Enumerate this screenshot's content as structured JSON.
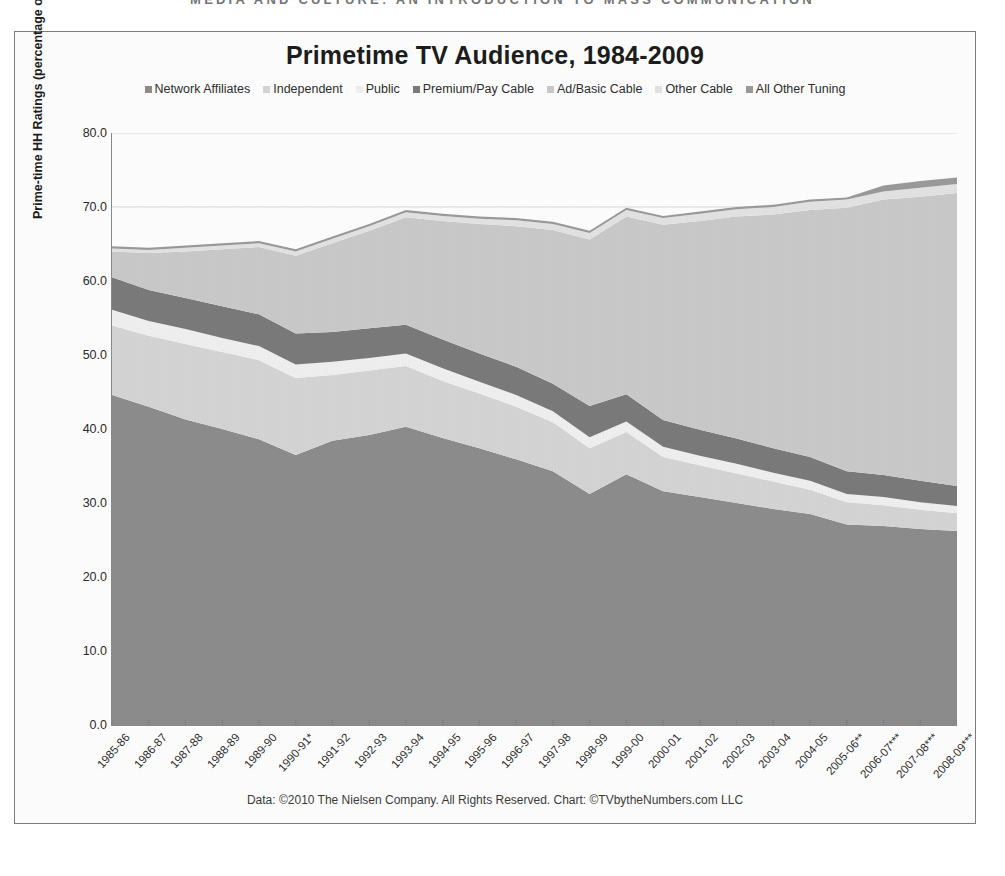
{
  "page_header": "MEDIA AND CULTURE: AN INTRODUCTION TO MASS COMMUNICATION",
  "footer_note": "Data: ©2010 The Nielsen Company. All Rights Reserved. Chart: ©TVbytheNumbers.com LLC",
  "chart_data": {
    "type": "area",
    "title": "Primetime TV Audience, 1984-2009",
    "xlabel": "",
    "ylabel": "Prime-time HH Ratings (percentage of US TV HHs)",
    "ylim": [
      0,
      80
    ],
    "yticks": [
      "0.0",
      "10.0",
      "20.0",
      "30.0",
      "40.0",
      "50.0",
      "60.0",
      "70.0",
      "80.0"
    ],
    "ytick_values": [
      0,
      10,
      20,
      30,
      40,
      50,
      60,
      70,
      80
    ],
    "grid": true,
    "legend_position": "top",
    "stacked": true,
    "categories": [
      "1985-86",
      "1986-87",
      "1987-88",
      "1988-89",
      "1989-90",
      "1990-91*",
      "1991-92",
      "1992-93",
      "1993-94",
      "1994-95",
      "1995-96",
      "1996-97",
      "1997-98",
      "1998-99",
      "1999-00",
      "2000-01",
      "2001-02",
      "2002-03",
      "2003-04",
      "2004-05",
      "2005-06**",
      "2006-07***",
      "2007-08***",
      "2008-09***"
    ],
    "series": [
      {
        "name": "Network Affiliates",
        "color": "#8c8c8c",
        "values": [
          44.6,
          43.0,
          41.3,
          40.0,
          38.6,
          36.5,
          38.4,
          39.2,
          40.3,
          38.8,
          37.4,
          35.9,
          34.3,
          31.2,
          33.9,
          31.6,
          30.8,
          30.0,
          29.2,
          28.5,
          27.1,
          26.9,
          26.5,
          26.2
        ]
      },
      {
        "name": "Independent",
        "color": "#d4d4d4",
        "values": [
          9.4,
          9.6,
          10.2,
          10.4,
          10.7,
          10.4,
          8.9,
          8.7,
          8.2,
          7.7,
          7.4,
          7.1,
          6.6,
          6.2,
          5.7,
          4.6,
          4.3,
          4.0,
          3.7,
          3.3,
          3.0,
          2.8,
          2.6,
          2.4
        ]
      },
      {
        "name": "Public",
        "color": "#efefef",
        "values": [
          2.1,
          2.0,
          2.0,
          1.9,
          1.9,
          1.8,
          1.8,
          1.7,
          1.7,
          1.7,
          1.6,
          1.6,
          1.5,
          1.5,
          1.4,
          1.4,
          1.3,
          1.3,
          1.2,
          1.2,
          1.1,
          1.1,
          1.0,
          1.0
        ]
      },
      {
        "name": "Premium/Pay Cable",
        "color": "#7a7a7a",
        "values": [
          4.4,
          4.2,
          4.2,
          4.3,
          4.3,
          4.2,
          4.0,
          4.0,
          3.9,
          3.9,
          3.8,
          3.8,
          3.7,
          4.2,
          3.7,
          3.6,
          3.5,
          3.4,
          3.3,
          3.2,
          3.1,
          3.0,
          2.9,
          2.7
        ]
      },
      {
        "name": "Ad/Basic Cable",
        "color": "#c9c9c9",
        "values": [
          3.5,
          5.0,
          6.3,
          7.7,
          9.1,
          10.5,
          12.0,
          13.2,
          14.5,
          16.0,
          17.5,
          19.0,
          20.8,
          22.5,
          24.0,
          26.4,
          28.2,
          30.0,
          31.6,
          33.4,
          35.6,
          37.2,
          38.4,
          39.6
        ]
      },
      {
        "name": "Other Cable",
        "color": "#e2e2e2",
        "values": [
          0.4,
          0.4,
          0.5,
          0.5,
          0.5,
          0.6,
          0.6,
          0.6,
          0.7,
          0.7,
          0.7,
          0.8,
          0.8,
          0.9,
          0.9,
          0.9,
          1.0,
          1.0,
          1.0,
          1.1,
          1.1,
          1.1,
          1.2,
          1.2
        ]
      },
      {
        "name": "All Other Tuning",
        "color": "#9a9a9a",
        "values": [
          0.3,
          0.3,
          0.3,
          0.3,
          0.3,
          0.3,
          0.3,
          0.3,
          0.3,
          0.3,
          0.3,
          0.3,
          0.3,
          0.3,
          0.3,
          0.3,
          0.3,
          0.3,
          0.3,
          0.3,
          0.3,
          0.8,
          0.9,
          0.9
        ]
      }
    ]
  }
}
